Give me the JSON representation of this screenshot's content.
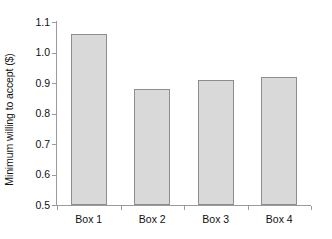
{
  "chart_data": {
    "type": "bar",
    "title": "",
    "xlabel": "",
    "ylabel": "Minimum willing to accept ($)",
    "categories": [
      "Box 1",
      "Box 2",
      "Box 3",
      "Box 4"
    ],
    "values": [
      1.06,
      0.88,
      0.91,
      0.92
    ],
    "ylim": [
      0.5,
      1.1
    ],
    "ytick_step": 0.1,
    "ytick_labels": [
      "1.1",
      "1.0",
      "0.9",
      "0.8",
      "0.7",
      "0.6",
      "0.5"
    ],
    "ytick_values": [
      1.1,
      1.0,
      0.9,
      0.8,
      0.7,
      0.6,
      0.5
    ],
    "grid": false,
    "legend": false,
    "series": [
      {
        "name": "Minimum willing to accept",
        "values": [
          1.06,
          0.88,
          0.91,
          0.92
        ]
      }
    ],
    "colors": {
      "bar_fill": "#d9d9d9",
      "bar_border": "#8d8d8d",
      "axis": "#9a9a9a",
      "text": "#111111",
      "background": "#ffffff"
    }
  }
}
